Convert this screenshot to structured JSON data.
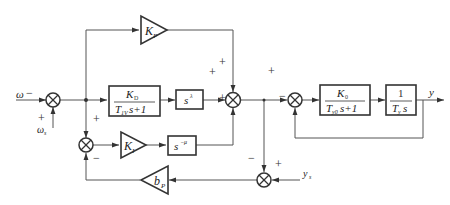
{
  "diagram": {
    "title": "",
    "inputs": {
      "omega": "ω",
      "omega_s": "ω",
      "omega_s_sub": "s",
      "y_s": "y",
      "y_s_sub": "s"
    },
    "output": {
      "y": "y"
    },
    "blocks": {
      "kp": {
        "label": "K",
        "sub": "P"
      },
      "kd": {
        "num": "K",
        "num_sub": "D",
        "den_a": "T",
        "den_sub": "1V",
        "den_b": "s+1"
      },
      "s_lambda": {
        "base": "s",
        "exp": "λ"
      },
      "ki": {
        "label": "K",
        "sub": "I"
      },
      "s_mu": {
        "base": "s",
        "exp": "−μ"
      },
      "bp": {
        "label": "b",
        "sub": "P"
      },
      "k0": {
        "num": "K",
        "num_sub": "0",
        "den_a": "T",
        "den_sub": "y0",
        "den_b": "s+1"
      },
      "integrator": {
        "num": "1",
        "den_a": "T",
        "den_sub": "y",
        "den_b": "s"
      }
    },
    "signs": {
      "sj1_omega": "−",
      "sj1_omega_s": "+",
      "sj2_top": "+",
      "sj2_left": "+",
      "sj2_bottom": "+",
      "sj3_top": "+",
      "sj3_bottom": "−",
      "sj4_left": "+",
      "sj4_bottom": "−",
      "sj5_top": "−",
      "sj5_right": "+"
    }
  }
}
